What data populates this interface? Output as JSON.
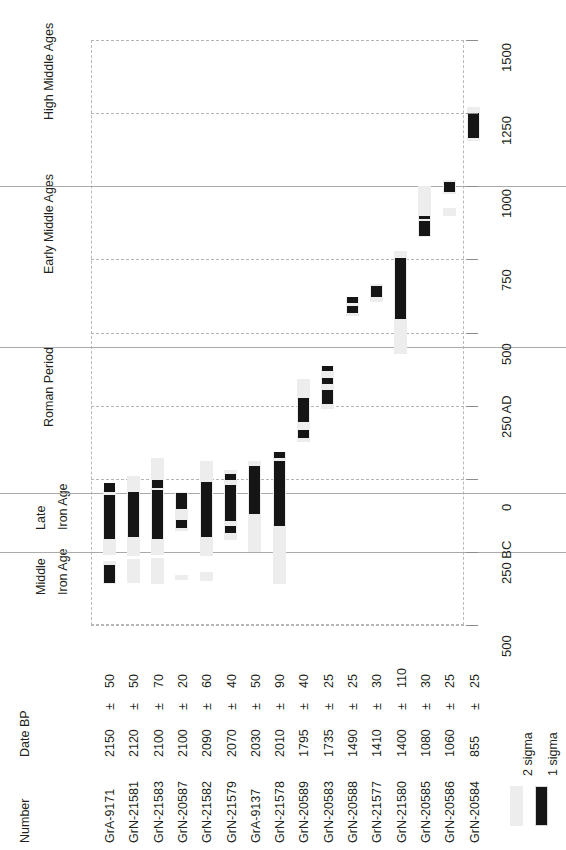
{
  "chart_data": {
    "type": "bar",
    "title": "",
    "subtitle": "",
    "xlabel": "",
    "ylabel": "",
    "orientation": "rotated-90",
    "grid": true,
    "legend_position": "bottom-right",
    "axis": {
      "name": "Calibrated calendar date",
      "range": [
        -500,
        1500
      ],
      "ticks": [
        {
          "value": 1500,
          "label": "1500"
        },
        {
          "value": 1250,
          "label": "1250"
        },
        {
          "value": 1000,
          "label": "1000"
        },
        {
          "value": 750,
          "label": "750"
        },
        {
          "value": 500,
          "label": "500"
        },
        {
          "value": 250,
          "label": "250 AD"
        },
        {
          "value": 0,
          "label": "0"
        },
        {
          "value": -250,
          "label": "250 BC"
        },
        {
          "value": -500,
          "label": "500"
        }
      ]
    },
    "periods": [
      {
        "label": "High Middle Ages",
        "start": 1000,
        "end": 1500
      },
      {
        "label": "Early Middle Ages",
        "start": 450,
        "end": 1000
      },
      {
        "label": "Roman Period",
        "start": -50,
        "end": 450
      },
      {
        "label": "Late Iron Age",
        "start": -250,
        "end": -50
      },
      {
        "label": "Middle Iron Age",
        "start": -500,
        "end": -250
      }
    ],
    "columns": {
      "number": "Number",
      "date_bp": "Date BP"
    },
    "legend": [
      {
        "key": "2 sigma",
        "label": "2 sigma",
        "color": "#ededed"
      },
      {
        "key": "1 sigma",
        "label": "1 sigma",
        "color": "#151515"
      }
    ],
    "samples": [
      {
        "number": "GrA-9171",
        "bp": "2150",
        "pm": "±",
        "sigma": "50",
        "date_bp_full": "2150 ± 50",
        "two_sigma": [
          [
            -360,
            -280
          ],
          [
            -260,
            -40
          ]
        ],
        "one_sigma": [
          [
            -355,
            -295
          ],
          [
            -205,
            -55
          ],
          [
            -45,
            -15
          ]
        ]
      },
      {
        "number": "GrN-21581",
        "bp": "2120",
        "pm": "±",
        "sigma": "50",
        "date_bp_full": "2120 ± 50",
        "two_sigma": [
          [
            -355,
            -275
          ],
          [
            -265,
            10
          ]
        ],
        "one_sigma": [
          [
            -200,
            -45
          ]
        ]
      },
      {
        "number": "GrN-21583",
        "bp": "2100",
        "pm": "±",
        "sigma": "70",
        "date_bp_full": "2100 ± 70",
        "two_sigma": [
          [
            -360,
            -270
          ],
          [
            -260,
            70
          ]
        ],
        "one_sigma": [
          [
            -205,
            -40
          ],
          [
            -30,
            -5
          ]
        ]
      },
      {
        "number": "GrN-20587",
        "bp": "2100",
        "pm": "±",
        "sigma": "20",
        "date_bp_full": "2100 ± 20",
        "two_sigma": [
          [
            -345,
            -330
          ],
          [
            -180,
            -45
          ]
        ],
        "one_sigma": [
          [
            -170,
            -140
          ],
          [
            -105,
            -50
          ]
        ]
      },
      {
        "number": "GrN-21582",
        "bp": "2090",
        "pm": "±",
        "sigma": "60",
        "date_bp_full": "2090 ± 60",
        "two_sigma": [
          [
            -350,
            -320
          ],
          [
            -265,
            60
          ]
        ],
        "one_sigma": [
          [
            -200,
            -10
          ]
        ]
      },
      {
        "number": "GrN-21579",
        "bp": "2070",
        "pm": "±",
        "sigma": "40",
        "date_bp_full": "2070 ± 40",
        "two_sigma": [
          [
            -210,
            30
          ]
        ],
        "one_sigma": [
          [
            -185,
            -160
          ],
          [
            -145,
            -20
          ],
          [
            -5,
            15
          ]
        ]
      },
      {
        "number": "GrA-9137",
        "bp": "2030",
        "pm": "±",
        "sigma": "50",
        "date_bp_full": "2030 ± 50",
        "two_sigma": [
          [
            -250,
            60
          ]
        ],
        "one_sigma": [
          [
            -120,
            45
          ]
        ]
      },
      {
        "number": "GrN-21578",
        "bp": "2010",
        "pm": "±",
        "sigma": "90",
        "date_bp_full": "2010 ± 90",
        "two_sigma": [
          [
            -360,
            90
          ]
        ],
        "one_sigma": [
          [
            -160,
            60
          ],
          [
            70,
            90
          ]
        ]
      },
      {
        "number": "GrN-20589",
        "bp": "1795",
        "pm": "±",
        "sigma": "40",
        "date_bp_full": "1795 ± 40",
        "two_sigma": [
          [
            125,
            340
          ]
        ],
        "one_sigma": [
          [
            140,
            165
          ],
          [
            195,
            275
          ]
        ]
      },
      {
        "number": "GrN-20583",
        "bp": "1735",
        "pm": "±",
        "sigma": "25",
        "date_bp_full": "1735 ± 25",
        "two_sigma": [
          [
            240,
            385
          ]
        ],
        "one_sigma": [
          [
            255,
            305
          ],
          [
            325,
            345
          ],
          [
            370,
            385
          ]
        ]
      },
      {
        "number": "GrN-20588",
        "bp": "1490",
        "pm": "±",
        "sigma": "25",
        "date_bp_full": "1490 ± 25",
        "two_sigma": [
          [
            555,
            620
          ]
        ],
        "one_sigma": [
          [
            565,
            590
          ],
          [
            600,
            620
          ]
        ]
      },
      {
        "number": "GrN-21577",
        "bp": "1410",
        "pm": "±",
        "sigma": "30",
        "date_bp_full": "1410 ± 30",
        "two_sigma": [
          [
            605,
            665
          ]
        ],
        "one_sigma": [
          [
            620,
            660
          ]
        ]
      },
      {
        "number": "GrN-21580",
        "bp": "1400",
        "pm": "±",
        "sigma": "110",
        "date_bp_full": "1400 ±110",
        "two_sigma": [
          [
            425,
            780
          ]
        ],
        "one_sigma": [
          [
            545,
            755
          ]
        ]
      },
      {
        "number": "GrN-20585",
        "bp": "1080",
        "pm": "±",
        "sigma": "30",
        "date_bp_full": "1080 ± 30",
        "two_sigma": [
          [
            825,
            1000
          ]
        ],
        "one_sigma": [
          [
            895,
            900
          ],
          [
            830,
            880
          ]
        ]
      },
      {
        "number": "GrN-20586",
        "bp": "1060",
        "pm": "±",
        "sigma": "25",
        "date_bp_full": "1060 ± 25",
        "two_sigma": [
          [
            900,
            925
          ],
          [
            975,
            1020
          ]
        ],
        "one_sigma": [
          [
            980,
            1015
          ]
        ]
      },
      {
        "number": "GrN-20584",
        "bp": "855",
        "pm": "±",
        "sigma": "25",
        "date_bp_full": "855 ± 25",
        "two_sigma": [
          [
            1155,
            1270
          ]
        ],
        "one_sigma": [
          [
            1165,
            1250
          ]
        ]
      }
    ]
  }
}
